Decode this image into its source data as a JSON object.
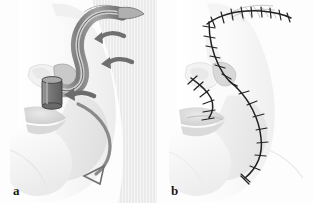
{
  "figure": {
    "type": "medical-illustration",
    "width": 313,
    "height": 203,
    "background_color": "#fdfdfd",
    "panels": [
      {
        "id": "a",
        "label": "a",
        "caption_position": "bottom-left",
        "description": "Lateral view of face showing forehead flap elevated and transposed to the nasal defect, with directional arrows indicating the rotation and inset of the flap and a cylindrical nasal stent in place.",
        "elements": {
          "face_outline": "lateral-profile-face",
          "flap": "tubed-paramedian-forehead-flap",
          "stent": "nasal-cylindrical-stent",
          "donor_site": "forehead-eyebrow-donor-site",
          "hatching": "vertical-shading-hatching-cheek",
          "arrows": [
            {
              "name": "upper-rotation-arrow",
              "direction": "leftward-curved"
            },
            {
              "name": "middle-transposition-arrow",
              "direction": "leftward-curved"
            },
            {
              "name": "inset-arrow",
              "direction": "leftward-into-stent"
            },
            {
              "name": "lower-chin-arrow",
              "direction": "downward-curved-open-head"
            }
          ]
        }
      },
      {
        "id": "b",
        "label": "b",
        "caption_position": "bottom-left",
        "description": "Lateral view of the same face after inset, showing continuous suture lines with cross-hatch stitch marks along the forehead donor site, the nasal sidewall, the alar base and the cheek down toward the chin.",
        "elements": {
          "face_outline": "lateral-profile-face",
          "suture_lines": [
            {
              "name": "forehead-donor-suture-line",
              "stitches": 9
            },
            {
              "name": "nasal-dorsum-suture-line",
              "stitches": 7
            },
            {
              "name": "alar-base-suture-line",
              "stitches": 6
            },
            {
              "name": "cheek-chin-suture-line",
              "stitches": 8
            }
          ]
        }
      }
    ],
    "colors": {
      "ink": "#2a2a2a",
      "skin_light": "#f7f7f7",
      "skin_mid": "#e3e3e3",
      "skin_shadow": "#cfcfcf",
      "flap_gray": "#8c8c8c",
      "flap_dark": "#6a6a6a",
      "arrow_gray": "#777777",
      "hatch_gray": "#dcdcdc",
      "label_color": "#1a1a1a",
      "divider": "#f2f2f2"
    }
  }
}
